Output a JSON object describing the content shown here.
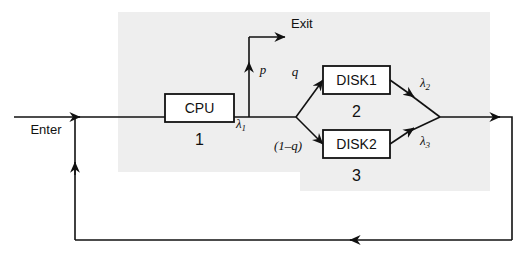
{
  "diagram": {
    "colors": {
      "line": "#111111",
      "shade": "#eeeeee",
      "box_fill": "#ffffff",
      "background": "#ffffff"
    },
    "nodes": [
      {
        "id": "cpu",
        "label": "CPU",
        "number": "1"
      },
      {
        "id": "disk1",
        "label": "DISK1",
        "number": "2"
      },
      {
        "id": "disk2",
        "label": "DISK2",
        "number": "3"
      }
    ],
    "terminals": {
      "enter": "Enter",
      "exit": "Exit"
    },
    "edge_labels": {
      "lambda1": "λ",
      "lambda1_sub": "1",
      "lambda2": "λ",
      "lambda2_sub": "2",
      "lambda3": "λ",
      "lambda3_sub": "3",
      "p": "p",
      "q": "q",
      "one_minus_q": "(1–q)"
    }
  }
}
